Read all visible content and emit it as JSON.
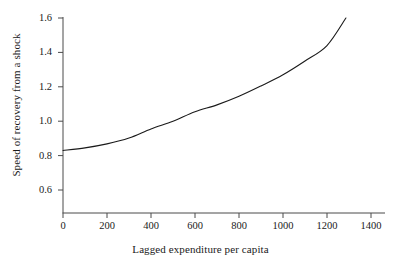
{
  "chart_data": {
    "type": "line",
    "title": "",
    "xlabel": "Lagged expenditure per capita",
    "ylabel": "Speed of recovery from a shock",
    "xlim": [
      0,
      1450
    ],
    "ylim": [
      0.52,
      1.62
    ],
    "xticks": [
      0,
      200,
      400,
      600,
      800,
      1000,
      1200,
      1400
    ],
    "xtick_labels": [
      "0",
      "200",
      "400",
      "600",
      "800",
      "1000",
      "1200",
      "1400"
    ],
    "yticks": [
      0.6,
      0.8,
      1.0,
      1.2,
      1.4,
      1.6
    ],
    "ytick_labels": [
      "0.6",
      "0.8",
      "1.0",
      "1.2",
      "1.4",
      "1.6"
    ],
    "grid": false,
    "legend": false,
    "line_color": "#1a1a1a",
    "line_width": 1,
    "series": [
      {
        "name": "Speed of recovery",
        "x": [
          0,
          100,
          200,
          300,
          400,
          500,
          600,
          700,
          800,
          900,
          1000,
          1100,
          1200,
          1286
        ],
        "y": [
          0.83,
          0.845,
          0.868,
          0.902,
          0.955,
          1.0,
          1.055,
          1.095,
          1.145,
          1.205,
          1.27,
          1.35,
          1.44,
          1.6
        ]
      }
    ]
  },
  "axis_geometry": {
    "x_origin_px": 63,
    "y_origin_px": 213,
    "x_right_px": 385,
    "y_top_px": 18,
    "px_per_200_x": 44,
    "px_per_0_2_y": 34.4
  }
}
